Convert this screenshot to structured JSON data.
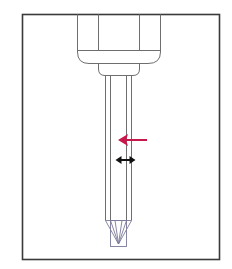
{
  "diagram": {
    "annotations": [
      {
        "id": "red-arrow",
        "meaning": "pointer",
        "direction": "left"
      },
      {
        "id": "width-arrow",
        "meaning": "width-dimension",
        "direction": "horizontal-double"
      }
    ]
  },
  "colors": {
    "background": "#ffffff",
    "line": "#6e6e6e",
    "frame": "#3a3a3a",
    "tip_lines": "#7a7a9a",
    "red_arrow": "#c8174a",
    "black_arrow": "#111111"
  }
}
